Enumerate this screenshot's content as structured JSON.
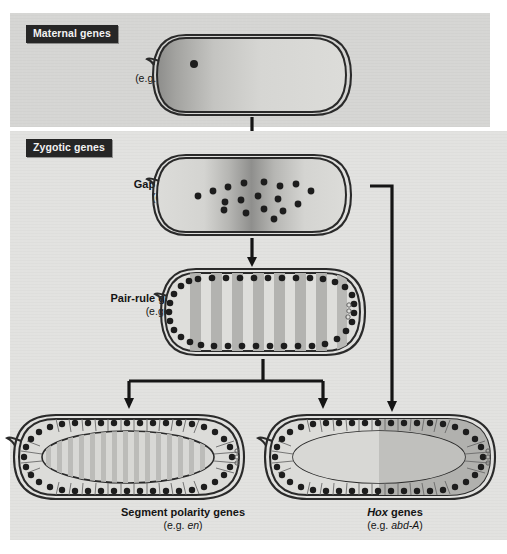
{
  "figure": {
    "background_color": "#ffffff",
    "panel_maternal_color": "#d6d6d4",
    "panel_zygotic_color": "#e2e2e0",
    "tag_background": "#262626",
    "tag_text_color": "#f2f2f2",
    "ink_color": "#1a1a1a"
  },
  "sections": {
    "maternal": {
      "tag": "Maternal genes"
    },
    "zygotic": {
      "tag": "Zygotic genes"
    }
  },
  "stages": [
    {
      "id": "maternal",
      "name_plain": "",
      "example_prefix": "(e.g. ",
      "example_gene": "bicoid",
      "example_suffix": ")",
      "nuclei_count": 1,
      "pattern": "anterior-posterior gradient, dark at anterior pole"
    },
    {
      "id": "gap",
      "name_plain": "Gap genes",
      "example_prefix": "(e.g. ",
      "example_gene": "Kr",
      "example_suffix": ")",
      "nuclei_count": 18,
      "pattern": "single broad central band"
    },
    {
      "id": "pair-rule",
      "name_plain": "Pair-rule genes",
      "example_prefix": "(e.g. ",
      "example_gene": "eve",
      "example_suffix": ")",
      "nuclei_count": 46,
      "stripes": 8,
      "pattern": "seven to eight transverse stripes, syncytial blastoderm nuclei at periphery"
    },
    {
      "id": "segment-polarity",
      "name_plain": "Segment polarity genes",
      "example_prefix": "(e.g. ",
      "example_gene": "en",
      "example_suffix": ")",
      "nuclei_count": 54,
      "stripes": 15,
      "pattern": "fourteen narrow stripes, cellular blastoderm"
    },
    {
      "id": "hox",
      "name_italic": "Hox",
      "name_plain": " genes",
      "example_prefix": "(e.g. ",
      "example_gene": "abd-A",
      "example_suffix": ")",
      "nuclei_count": 54,
      "pattern": "posterior half domain, sharp anterior boundary at mid-embryo"
    }
  ],
  "arrows": [
    {
      "id": "maternal-to-gap",
      "from": "maternal",
      "to": "gap",
      "style": "straight-down"
    },
    {
      "id": "gap-to-pairrule",
      "from": "gap",
      "to": "pair-rule",
      "style": "straight-down"
    },
    {
      "id": "pairrule-branch",
      "from": "pair-rule",
      "to": "segment-polarity and hox",
      "style": "t-branch"
    },
    {
      "id": "gap-to-hox",
      "from": "gap",
      "to": "hox",
      "style": "right-bypass"
    }
  ]
}
